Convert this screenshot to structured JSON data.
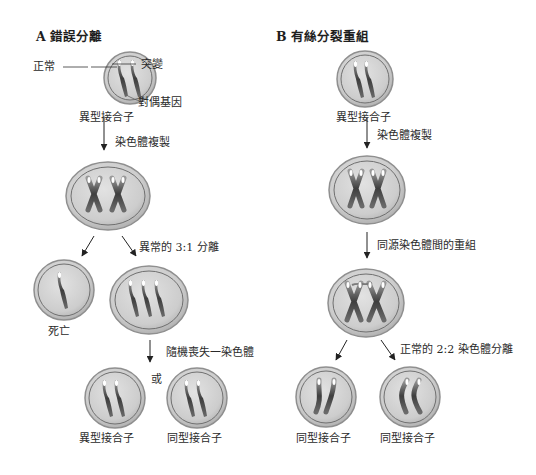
{
  "panel_a": {
    "title": "A 錯誤分離",
    "labels": {
      "normal": "正常",
      "mutation": "突變",
      "allele": "對偶基因",
      "start_cell": "異型接合子",
      "replication": "染色體複製",
      "abnormal_split": "異常的 3:1 分離",
      "death": "死亡",
      "random_loss": "隨機喪失一染色體",
      "or": "或",
      "result_hetero": "異型接合子",
      "result_homo": "同型接合子"
    }
  },
  "panel_b": {
    "title": "B 有絲分裂重組",
    "labels": {
      "start_cell": "異型接合子",
      "replication": "染色體複製",
      "recombination": "同源染色體間的重組",
      "normal_split": "正常的 2:2 染色體分離",
      "result_homo_1": "同型接合子",
      "result_homo_2": "同型接合子"
    }
  },
  "colors": {
    "cell_fill": "#c9c9c9",
    "cell_ring": "#8a8a8a",
    "chromosome": "#4a4a4a",
    "arrow": "#222222"
  }
}
